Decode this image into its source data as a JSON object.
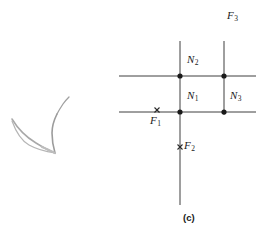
{
  "figure": {
    "caption": "(c)",
    "background_color": "#ffffff",
    "line_color": "#3a3a3a",
    "node_color": "#1a1a1a",
    "sketch_color": "#9a9a9a",
    "nodes": [
      {
        "id": "N2",
        "label": "N",
        "subscript": "2",
        "x": 180,
        "y": 76,
        "label_x": 186,
        "label_y": 60
      },
      {
        "id": "N1",
        "label": "N",
        "subscript": "1",
        "x": 180,
        "y": 112,
        "label_x": 186,
        "label_y": 95
      },
      {
        "id": "N3",
        "label": "N",
        "subscript": "3",
        "x": 224,
        "y": 112,
        "label_x": 230,
        "label_y": 95
      },
      {
        "id": "Nx",
        "label": "",
        "subscript": "",
        "x": 224,
        "y": 76,
        "label_x": 0,
        "label_y": 0
      }
    ],
    "faces": [
      {
        "id": "F1",
        "label": "F",
        "subscript": "1",
        "mark_x": 157,
        "mark_y": 110,
        "label_x": 150,
        "label_y": 116
      },
      {
        "id": "F2",
        "label": "F",
        "subscript": "2",
        "mark_x": 180,
        "mark_y": 147,
        "label_x": 184,
        "label_y": 140
      },
      {
        "id": "F3",
        "label": "F",
        "subscript": "3",
        "mark_x": 0,
        "mark_y": 0,
        "label_x": 227,
        "label_y": 9
      }
    ],
    "edges": {
      "horizontal_upper": {
        "x1": 119,
        "y1": 76,
        "x2": 256,
        "y2": 76
      },
      "horizontal_lower": {
        "x1": 119,
        "y1": 112,
        "x2": 256,
        "y2": 112
      },
      "vertical_main": {
        "x1": 180,
        "y1": 41,
        "x2": 180,
        "y2": 205
      },
      "vertical_right": {
        "x1": 224,
        "y1": 41,
        "x2": 224,
        "y2": 115
      }
    },
    "sketch_strokes": [
      "M 12,119 C 18,129 26,137 36,143 C 44,148 50,151 55,153",
      "M 55,153 C 48,152 38,150 29,145 C 22,141 16,132 12,121",
      "M 55,153 C 53,146 52,140 52,134 C 52,126 54,120 57,114",
      "M 57,114 C 60,110 62,107 64,104 C 66,101 68,99 70,98"
    ]
  }
}
